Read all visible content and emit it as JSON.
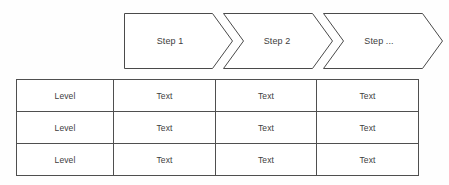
{
  "diagram": {
    "type": "process-chevron-with-matrix-table",
    "background_color": "#fefefe",
    "stroke_color": "#4a4a4a",
    "text_color": "#3d3d3d",
    "process": {
      "steps": [
        {
          "label": "Step 1"
        },
        {
          "label": "Step 2"
        },
        {
          "label": "Step ..."
        }
      ]
    },
    "table": {
      "columns": 4,
      "rows": [
        {
          "cells": [
            "Level",
            "Text",
            "Text",
            "Text"
          ]
        },
        {
          "cells": [
            "Level",
            "Text",
            "Text",
            "Text"
          ]
        },
        {
          "cells": [
            "Level",
            "Text",
            "Text",
            "Text"
          ]
        }
      ]
    }
  }
}
